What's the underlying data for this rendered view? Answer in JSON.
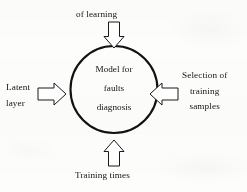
{
  "diagram": {
    "type": "hub-and-spoke",
    "title": "Model for faults diagnosis",
    "colors": {
      "background": "#fdfdfc",
      "stroke": "#111111",
      "arrow_fill": "#ffffff",
      "text": "#141414"
    },
    "center": {
      "shape": "circle",
      "lines": [
        "Model for",
        "faults",
        "diagnosis"
      ]
    },
    "inputs": [
      {
        "id": "top",
        "label_lines": [
          "of learning"
        ],
        "arrow": "down-arrow",
        "direction": "down"
      },
      {
        "id": "left",
        "label_lines": [
          "Latent",
          "layer"
        ],
        "arrow": "right-arrow",
        "direction": "right"
      },
      {
        "id": "right",
        "label_lines": [
          "Selection of",
          "training",
          "samples"
        ],
        "arrow": "left-arrow",
        "direction": "left"
      },
      {
        "id": "bottom",
        "label_lines": [
          "Training times"
        ],
        "arrow": "up-arrow",
        "direction": "up"
      }
    ]
  }
}
